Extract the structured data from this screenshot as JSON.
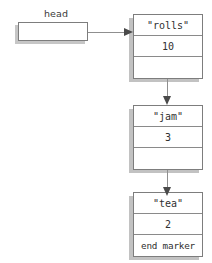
{
  "diagram": {
    "pointer": {
      "label": "head",
      "box_value": ""
    },
    "nodes": [
      {
        "id": "node-rolls",
        "data_label": "\"rolls\"",
        "count_label": "10",
        "next_label": ""
      },
      {
        "id": "node-jam",
        "data_label": "\"jam\"",
        "count_label": "3",
        "next_label": ""
      },
      {
        "id": "node-tea",
        "data_label": "\"tea\"",
        "count_label": "2",
        "next_label": "end marker"
      }
    ],
    "colors": {
      "border": "#7d7d7d",
      "shadow": "#c2c2c2",
      "connector": "#8f8f8f",
      "arrowhead": "#4a4a4a",
      "text": "#303030",
      "background": "#ffffff"
    }
  }
}
